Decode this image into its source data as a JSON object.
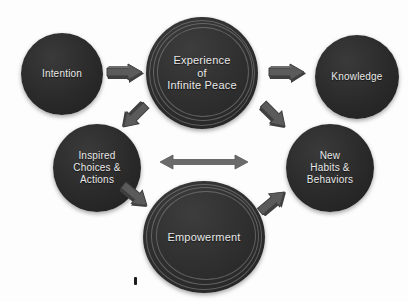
{
  "diagram": {
    "background_color": "#fdfdfd",
    "node_color": "#2b2b2b",
    "node_text_color": "#e9e9e9",
    "arrow_color": "#5a5a5a",
    "nodes": [
      {
        "id": "experience",
        "label": "Experience\nof\nInfinite Peace",
        "lines": [
          "Experience",
          "of",
          "Infinite Peace"
        ],
        "style": "ringed"
      },
      {
        "id": "intention",
        "label": "Intention",
        "lines": [
          "Intention"
        ],
        "style": "plain"
      },
      {
        "id": "knowledge",
        "label": "Knowledge",
        "lines": [
          "Knowledge"
        ],
        "style": "plain"
      },
      {
        "id": "inspired",
        "label": "Inspired Choices & Actions",
        "lines": [
          "Inspired",
          "Choices &",
          "Actions"
        ],
        "style": "plain"
      },
      {
        "id": "habits",
        "label": "New Habits & Behaviors",
        "lines": [
          "New",
          "Habits &",
          "Behaviors"
        ],
        "style": "plain"
      },
      {
        "id": "empowerment",
        "label": "Empowerment",
        "lines": [
          "Empowerment"
        ],
        "style": "ringed"
      }
    ],
    "arrows": [
      {
        "id": "intention-to-experience",
        "from": "intention",
        "to": "experience",
        "direction": "right",
        "shape": "block-3d"
      },
      {
        "id": "experience-to-knowledge",
        "from": "experience",
        "to": "knowledge",
        "direction": "right",
        "shape": "block-3d"
      },
      {
        "id": "experience-to-inspired",
        "from": "experience",
        "to": "inspired",
        "direction": "down-left",
        "shape": "block-3d"
      },
      {
        "id": "experience-to-habits",
        "from": "experience",
        "to": "habits",
        "direction": "down-right",
        "shape": "block-3d"
      },
      {
        "id": "inspired-to-empowerment",
        "from": "inspired",
        "to": "empowerment",
        "direction": "down-right",
        "shape": "block-3d"
      },
      {
        "id": "empowerment-to-habits",
        "from": "empowerment",
        "to": "habits",
        "direction": "up-right",
        "shape": "block-3d"
      },
      {
        "id": "inspired-habits-bidirectional",
        "from": "inspired",
        "to": "habits",
        "direction": "both",
        "shape": "double-headed"
      }
    ]
  }
}
